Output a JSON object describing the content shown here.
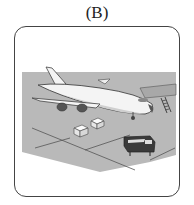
{
  "option_label": "(B)",
  "illustration": {
    "description": "Airplane parked on airport tarmac with two cargo boxes and a small truck",
    "elements": [
      "airplane",
      "tarmac",
      "boarding-stairs",
      "cargo-box",
      "cargo-box",
      "truck"
    ],
    "colors": {
      "tarmac": "#b9b9b9",
      "outline": "#333333",
      "plane": "#f4f4f4",
      "truck": "#3a3a3a"
    }
  }
}
